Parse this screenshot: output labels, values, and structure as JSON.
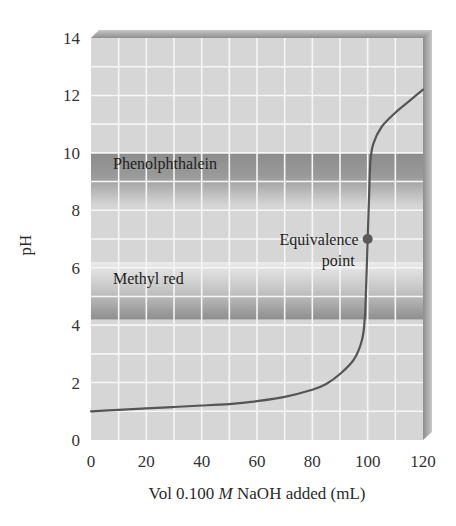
{
  "chart_data": {
    "type": "line",
    "title": "",
    "xlabel": "Vol 0.100 M NaOH added (mL)",
    "xlabel_parts": {
      "prefix": "Vol 0.100 ",
      "italic": "M",
      "suffix": " NaOH added (mL)"
    },
    "ylabel": "pH",
    "xlim": [
      0,
      120
    ],
    "ylim": [
      0,
      14
    ],
    "x_ticks": [
      0,
      20,
      40,
      60,
      80,
      100,
      120
    ],
    "y_ticks": [
      0,
      2,
      4,
      6,
      8,
      10,
      12,
      14
    ],
    "grid": true,
    "grid_minor_x": 10,
    "grid_minor_y": 1,
    "series": [
      {
        "name": "Titration curve",
        "x": [
          0,
          10,
          20,
          30,
          40,
          50,
          60,
          70,
          80,
          85,
          90,
          95,
          98,
          99,
          99.5,
          100,
          100.5,
          101,
          102,
          105,
          110,
          115,
          120
        ],
        "y": [
          1.0,
          1.05,
          1.1,
          1.15,
          1.2,
          1.25,
          1.35,
          1.5,
          1.75,
          1.95,
          2.3,
          2.8,
          3.5,
          4.3,
          5.5,
          7.0,
          8.5,
          9.7,
          10.3,
          10.9,
          11.4,
          11.8,
          12.2
        ]
      }
    ],
    "bands": [
      {
        "name": "Phenolphthalein",
        "y_from": 8.2,
        "y_to": 10.0,
        "dark_edge": "top"
      },
      {
        "name": "Methyl red",
        "y_from": 4.2,
        "y_to": 6.2,
        "dark_edge": "bottom"
      }
    ],
    "annotations": [
      {
        "text_lines": [
          "Equivalence",
          "point"
        ],
        "x": 100,
        "y": 7.0,
        "marker": "circle"
      }
    ]
  },
  "colors": {
    "plot_bg": "#d6d6d6",
    "grid": "#f4f4f4",
    "band_dark": "#8f8f8f",
    "band_light": "#e6e6e6",
    "curve": "#555555",
    "shadow": "#9a9a9a"
  }
}
